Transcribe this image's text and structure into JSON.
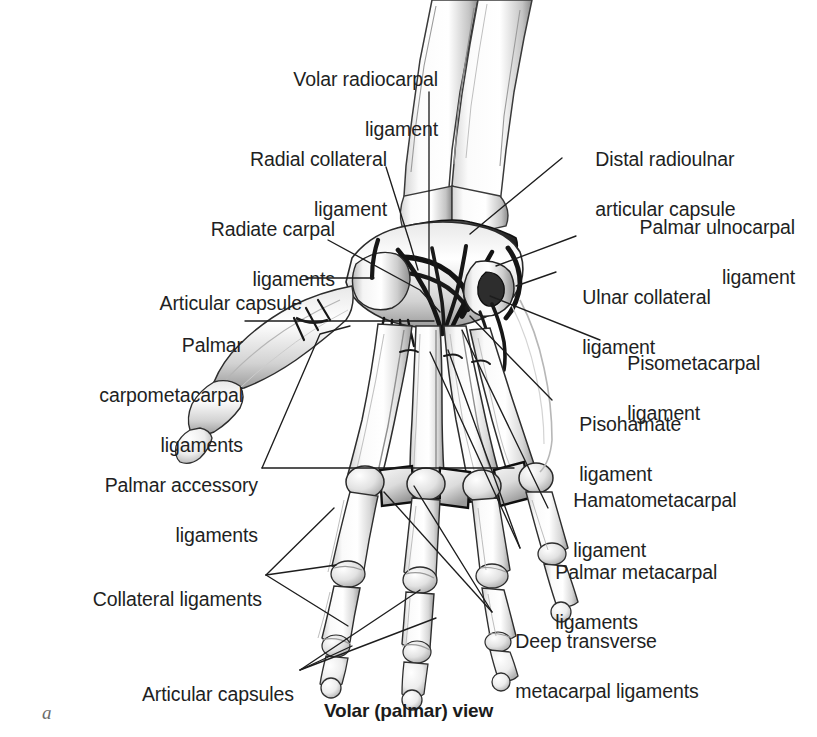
{
  "figure": {
    "panel_letter": "a",
    "caption": "Volar (palmar) view",
    "view": "volar (palmar)",
    "background_color": "#ffffff",
    "text_color": "#221f1f",
    "line_color": "#1d1d1d"
  },
  "labels": {
    "volar_radiocarpal": {
      "line1": "Volar radiocarpal",
      "line2": "ligament"
    },
    "radial_collateral": {
      "line1": "Radial collateral",
      "line2": "ligament"
    },
    "radiate_carpal": {
      "line1": "Radiate carpal",
      "line2": "ligaments"
    },
    "articular_capsule": {
      "line1": "Articular capsule"
    },
    "palmar_carpometacarpal": {
      "line1": "Palmar",
      "line2": "carpometacarpal",
      "line3": "ligaments"
    },
    "palmar_accessory": {
      "line1": "Palmar accessory",
      "line2": "ligaments"
    },
    "collateral_ligaments": {
      "line1": "Collateral ligaments"
    },
    "articular_capsules": {
      "line1": "Articular capsules"
    },
    "distal_radioulnar": {
      "line1": "Distal radioulnar",
      "line2": "articular capsule"
    },
    "palmar_ulnocarpal": {
      "line1": "Palmar ulnocarpal",
      "line2": "ligament"
    },
    "ulnar_collateral": {
      "line1": "Ulnar collateral",
      "line2": "ligament"
    },
    "pisometacarpal": {
      "line1": "Pisometacarpal",
      "line2": "ligament"
    },
    "pisohamate": {
      "line1": "Pisohamate",
      "line2": "ligament"
    },
    "hamatometacarpal": {
      "line1": "Hamatometacarpal",
      "line2": "ligament"
    },
    "palmar_metacarpal": {
      "line1": "Palmar metacarpal",
      "line2": "ligaments"
    },
    "deep_transverse": {
      "line1": "Deep transverse",
      "line2": "metacarpal ligaments"
    }
  }
}
